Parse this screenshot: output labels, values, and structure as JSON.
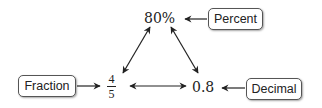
{
  "diagram": {
    "nodes": {
      "percent_value": "80%",
      "fraction_numerator": "4",
      "fraction_denominator": "5",
      "decimal_value": "0.8"
    },
    "labels": {
      "percent": "Percent",
      "fraction": "Fraction",
      "decimal": "Decimal"
    },
    "edges": [
      {
        "from": "80%",
        "to": "4/5",
        "type": "double-arrow"
      },
      {
        "from": "80%",
        "to": "0.8",
        "type": "double-arrow"
      },
      {
        "from": "4/5",
        "to": "0.8",
        "type": "double-arrow"
      },
      {
        "from": "Percent",
        "to": "80%",
        "type": "arrow"
      },
      {
        "from": "Fraction",
        "to": "4/5",
        "type": "arrow"
      },
      {
        "from": "Decimal",
        "to": "0.8",
        "type": "arrow"
      }
    ],
    "colors": {
      "line": "#222222",
      "box_border": "#555555"
    }
  }
}
